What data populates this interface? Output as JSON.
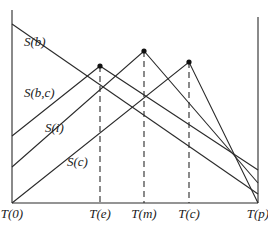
{
  "diagram": {
    "curves": [
      {
        "label": "S(b)",
        "label_pos": [
          24,
          46
        ],
        "points": [
          [
            12,
            24
          ],
          [
            258,
            194
          ]
        ]
      },
      {
        "label": "S(b,c)",
        "label_pos": [
          24,
          97
        ],
        "points": [
          [
            12,
            136
          ],
          [
            100,
            66
          ],
          [
            258,
            170
          ]
        ]
      },
      {
        "label": "S(i)",
        "label_pos": [
          45,
          132
        ],
        "points": [
          [
            12,
            167
          ],
          [
            144,
            51
          ],
          [
            258,
            183
          ]
        ]
      },
      {
        "label": "S(c)",
        "label_pos": [
          67,
          166
        ],
        "points": [
          [
            12,
            203
          ],
          [
            189,
            62
          ],
          [
            258,
            203
          ]
        ]
      }
    ],
    "peaks": [
      [
        100,
        66
      ],
      [
        144,
        51
      ],
      [
        189,
        62
      ]
    ],
    "x_ticks": [
      {
        "label": "T(0)",
        "x": 12
      },
      {
        "label": "T(e)",
        "x": 100
      },
      {
        "label": "T(m)",
        "x": 144
      },
      {
        "label": "T(c)",
        "x": 189
      },
      {
        "label": "T(p)",
        "x": 258
      }
    ],
    "axes": {
      "left": {
        "x": 12,
        "y_top": 10,
        "y_bottom": 203
      },
      "right": {
        "x": 258,
        "y_top": 17,
        "y_bottom": 203
      },
      "baseline": {
        "y": 203,
        "x_left": 12,
        "x_right": 258
      }
    }
  }
}
